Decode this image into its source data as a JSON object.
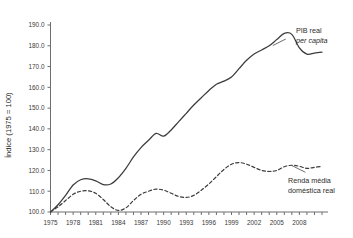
{
  "chart_data": {
    "type": "line",
    "title": "",
    "xlabel": "",
    "ylabel": "Índice (1975 = 100)",
    "xlim": [
      1975,
      2011
    ],
    "ylim": [
      100.0,
      190.0
    ],
    "grid": false,
    "legend_position": "inline-right",
    "x_ticks": [
      1975,
      1978,
      1981,
      1984,
      1987,
      1990,
      1993,
      1996,
      1999,
      2002,
      2005,
      2008
    ],
    "x_tick_labels": [
      "1975",
      "1978",
      "1981",
      "1984",
      "1987",
      "1990",
      "1993",
      "1996",
      "1999",
      "2002",
      "2005",
      "2008"
    ],
    "y_ticks": [
      100.0,
      110.0,
      120.0,
      130.0,
      140.0,
      150.0,
      160.0,
      170.0,
      180.0,
      190.0
    ],
    "y_tick_labels": [
      "100.0",
      "110.0",
      "120.0",
      "130.0",
      "140.0",
      "150.0",
      "160.0",
      "170.0",
      "180.0",
      "190.0"
    ],
    "x": [
      1975,
      1976,
      1977,
      1978,
      1979,
      1980,
      1981,
      1982,
      1983,
      1984,
      1985,
      1986,
      1987,
      1988,
      1989,
      1990,
      1991,
      1992,
      1993,
      1994,
      1995,
      1996,
      1997,
      1998,
      1999,
      2000,
      2001,
      2002,
      2003,
      2004,
      2005,
      2006,
      2007,
      2008,
      2009,
      2010,
      2011
    ],
    "series": [
      {
        "name": "PIB real per capita",
        "label_line1": "PIB real",
        "label_line2": "per capita",
        "style": "solid",
        "color": "#3c3c3c",
        "values": [
          100.0,
          103.5,
          108.0,
          113.0,
          115.5,
          116.0,
          115.0,
          113.2,
          113.5,
          116.5,
          121.0,
          126.5,
          131.0,
          134.5,
          137.8,
          136.5,
          139.5,
          143.5,
          147.5,
          151.5,
          155.0,
          158.5,
          161.5,
          163.0,
          165.0,
          169.0,
          173.0,
          176.0,
          178.0,
          180.0,
          183.0,
          186.0,
          185.5,
          179.0,
          176.0,
          176.5,
          177.0
        ]
      },
      {
        "name": "Renda média doméstica real",
        "label_line1": "Renda média",
        "label_line2": "doméstica real",
        "style": "dashed",
        "color": "#3c3c3c",
        "values": [
          100.0,
          102.5,
          105.5,
          108.5,
          110.0,
          110.2,
          109.0,
          106.0,
          102.5,
          100.8,
          102.0,
          105.5,
          108.5,
          110.0,
          111.0,
          110.5,
          109.0,
          107.5,
          107.0,
          108.0,
          110.5,
          113.5,
          117.0,
          120.5,
          123.0,
          123.8,
          123.0,
          121.5,
          120.0,
          119.5,
          120.0,
          121.8,
          122.5,
          122.0,
          121.0,
          121.5,
          122.0
        ]
      }
    ]
  },
  "axis": {
    "y_title": "Índice (1975 = 100)"
  }
}
